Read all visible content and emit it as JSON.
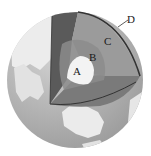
{
  "diagram": {
    "labels": [
      {
        "id": "A",
        "text": "A",
        "x": 73,
        "y": 66
      },
      {
        "id": "B",
        "text": "B",
        "x": 89,
        "y": 52
      },
      {
        "id": "C",
        "text": "C",
        "x": 104,
        "y": 36
      },
      {
        "id": "D",
        "text": "D",
        "x": 127,
        "y": 14
      }
    ],
    "colors": {
      "background": "#ffffff",
      "ocean": "#a9a9a9",
      "land": "#e6e6e6",
      "layer_A": "#f2f2f2",
      "layer_B": "#8a8a8a",
      "layer_C": "#9a9a9a",
      "layer_wall_dark": "#5c5c5c",
      "layer_floor": "#7d7d7d",
      "outline": "#333333"
    }
  }
}
